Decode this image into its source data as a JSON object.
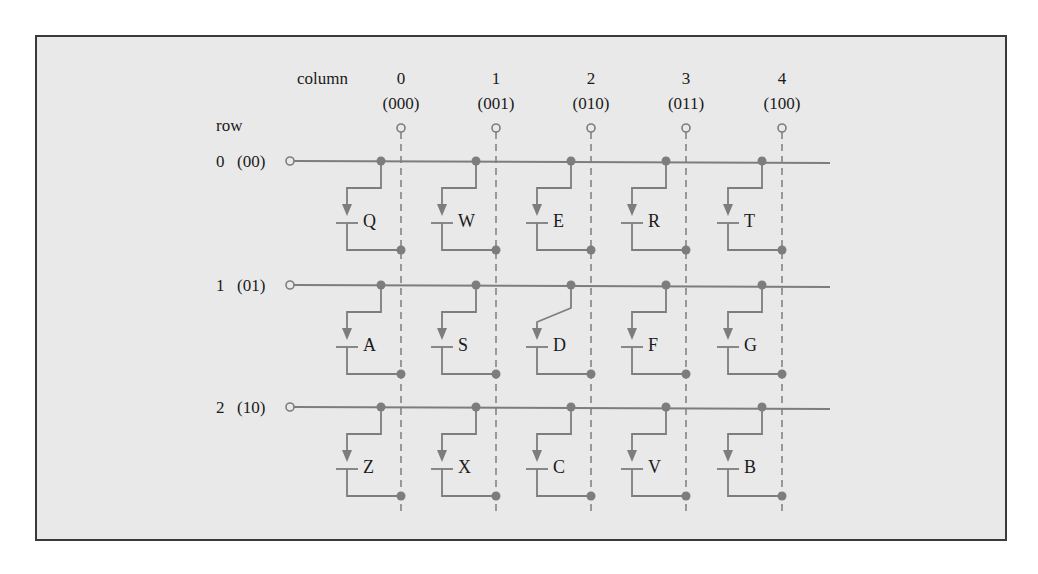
{
  "diagram": {
    "type": "keyboard-matrix",
    "column_header": "column",
    "row_header": "row",
    "columns": [
      {
        "index": "0",
        "code": "(000)"
      },
      {
        "index": "1",
        "code": "(001)"
      },
      {
        "index": "2",
        "code": "(010)"
      },
      {
        "index": "3",
        "code": "(011)"
      },
      {
        "index": "4",
        "code": "(100)"
      }
    ],
    "rows": [
      {
        "index": "0",
        "code": "(00)",
        "keys": [
          "Q",
          "W",
          "E",
          "R",
          "T"
        ]
      },
      {
        "index": "1",
        "code": "(01)",
        "keys": [
          "A",
          "S",
          "D",
          "F",
          "G"
        ]
      },
      {
        "index": "2",
        "code": "(10)",
        "keys": [
          "Z",
          "X",
          "C",
          "V",
          "B"
        ]
      }
    ],
    "closed_switch": "D",
    "colors": {
      "background": "#e9e9e9",
      "border": "#3a3a3a",
      "wire": "#7d7d7d",
      "text": "#1a1a1a"
    }
  }
}
